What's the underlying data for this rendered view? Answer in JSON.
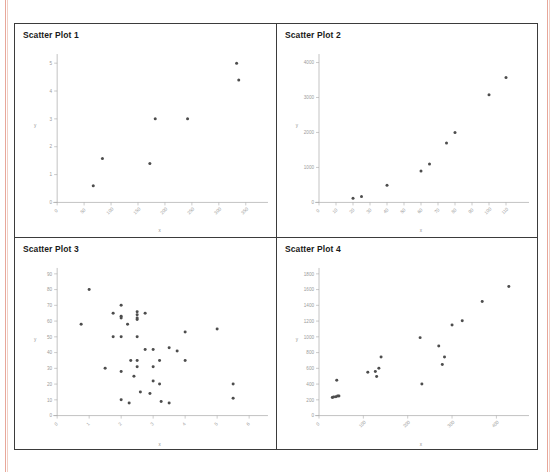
{
  "document": {
    "top_clipped_text": "",
    "background_color": "#ffffff",
    "margin_rule_color": "#e8a79a",
    "table_border_color": "#3b3b3b",
    "point_color": "#4d4d4d",
    "axis_color": "#a9a9a9",
    "tick_label_color": "#9a9a9a"
  },
  "panels": [
    {
      "title": "Scatter Plot 1"
    },
    {
      "title": "Scatter Plot 2"
    },
    {
      "title": "Scatter Plot 3"
    },
    {
      "title": "Scatter Plot 4"
    }
  ],
  "chart_data": [
    {
      "type": "scatter",
      "title": "Scatter Plot 1",
      "xlabel": "x",
      "ylabel": "y",
      "xlim": [
        0,
        380
      ],
      "ylim": [
        0,
        5.4
      ],
      "xticks": [
        0,
        50,
        100,
        150,
        200,
        250,
        300,
        350
      ],
      "yticks": [
        0,
        1,
        2,
        3,
        4,
        5
      ],
      "grid": false,
      "legend": "none",
      "points": [
        [
          67,
          0.6
        ],
        [
          84,
          1.58
        ],
        [
          172,
          1.4
        ],
        [
          182,
          3.0
        ],
        [
          242,
          3.0
        ],
        [
          333,
          5.0
        ],
        [
          337,
          4.4
        ]
      ]
    },
    {
      "type": "scatter",
      "title": "Scatter Plot 2",
      "xlabel": "x",
      "ylabel": "y",
      "xlim": [
        0,
        120
      ],
      "ylim": [
        0,
        4300
      ],
      "xticks": [
        0,
        10,
        20,
        30,
        40,
        50,
        60,
        70,
        80,
        90,
        100,
        110
      ],
      "yticks": [
        0,
        1000,
        2000,
        3000,
        4000
      ],
      "grid": false,
      "legend": "none",
      "points": [
        [
          20,
          120
        ],
        [
          25,
          170
        ],
        [
          40,
          490
        ],
        [
          60,
          900
        ],
        [
          65,
          1100
        ],
        [
          75,
          1700
        ],
        [
          80,
          2000
        ],
        [
          100,
          3080
        ],
        [
          110,
          3570
        ]
      ]
    },
    {
      "type": "scatter",
      "title": "Scatter Plot 3",
      "xlabel": "x",
      "ylabel": "y",
      "xlim": [
        0,
        6.4
      ],
      "ylim": [
        0,
        95
      ],
      "xticks": [
        0,
        1,
        2,
        3,
        4,
        5,
        6
      ],
      "yticks": [
        0,
        10,
        20,
        30,
        40,
        50,
        60,
        70,
        80,
        90
      ],
      "grid": false,
      "legend": "none",
      "points": [
        [
          0.75,
          58
        ],
        [
          1.0,
          80
        ],
        [
          1.5,
          30
        ],
        [
          1.75,
          65
        ],
        [
          1.75,
          50
        ],
        [
          2.0,
          70
        ],
        [
          2.0,
          63
        ],
        [
          2.0,
          62
        ],
        [
          2.0,
          50
        ],
        [
          2.0,
          28
        ],
        [
          2.0,
          10
        ],
        [
          2.2,
          58
        ],
        [
          2.25,
          8
        ],
        [
          2.3,
          35
        ],
        [
          2.4,
          25
        ],
        [
          2.5,
          66
        ],
        [
          2.5,
          64
        ],
        [
          2.5,
          62
        ],
        [
          2.5,
          61
        ],
        [
          2.5,
          50
        ],
        [
          2.5,
          35
        ],
        [
          2.5,
          31
        ],
        [
          2.6,
          15
        ],
        [
          2.75,
          65
        ],
        [
          2.75,
          42
        ],
        [
          2.9,
          14
        ],
        [
          3.0,
          42
        ],
        [
          3.0,
          31
        ],
        [
          3.0,
          22
        ],
        [
          3.2,
          35
        ],
        [
          3.2,
          20
        ],
        [
          3.25,
          9
        ],
        [
          3.5,
          43
        ],
        [
          3.5,
          8
        ],
        [
          3.75,
          41
        ],
        [
          4.0,
          53
        ],
        [
          4.0,
          35
        ],
        [
          5.0,
          55
        ],
        [
          5.5,
          20
        ],
        [
          5.5,
          11
        ]
      ]
    },
    {
      "type": "scatter",
      "title": "Scatter Plot 4",
      "xlabel": "x",
      "ylabel": "y",
      "xlim": [
        0,
        460
      ],
      "ylim": [
        0,
        1900
      ],
      "xticks": [
        0,
        100,
        200,
        300,
        400
      ],
      "yticks": [
        0,
        200,
        400,
        600,
        800,
        1000,
        1200,
        1400,
        1600,
        1800
      ],
      "grid": false,
      "legend": "none",
      "points": [
        [
          30,
          230
        ],
        [
          33,
          235
        ],
        [
          38,
          240
        ],
        [
          42,
          250
        ],
        [
          45,
          250
        ],
        [
          40,
          450
        ],
        [
          110,
          550
        ],
        [
          127,
          560
        ],
        [
          130,
          495
        ],
        [
          135,
          600
        ],
        [
          140,
          745
        ],
        [
          228,
          990
        ],
        [
          232,
          400
        ],
        [
          270,
          885
        ],
        [
          278,
          650
        ],
        [
          283,
          745
        ],
        [
          300,
          1150
        ],
        [
          323,
          1205
        ],
        [
          368,
          1450
        ],
        [
          428,
          1640
        ]
      ]
    }
  ]
}
